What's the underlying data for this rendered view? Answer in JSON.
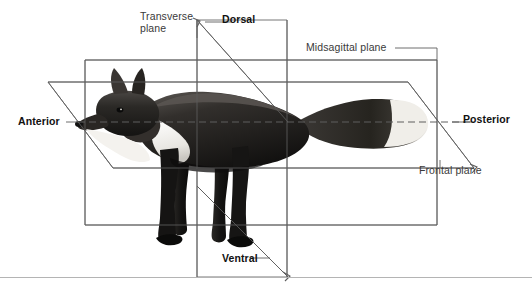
{
  "figure": {
    "background_color": "#ffffff",
    "line_color": "#555555",
    "dashed_line_color": "#666666",
    "rule_color": "#b4b4b4"
  },
  "labels": {
    "transverse_plane": "Transverse\nplane",
    "dorsal": "Dorsal",
    "midsagittal_plane": "Midsagittal plane",
    "anterior": "Anterior",
    "posterior": "Posterior",
    "frontal_plane": "Frontal plane",
    "ventral": "Ventral"
  },
  "planes": [
    {
      "name": "midsagittal-plane",
      "shape": "rectangle",
      "label": "Midsagittal plane",
      "points": "85,60 437,60 437,225 85,225"
    },
    {
      "name": "frontal-plane",
      "shape": "parallelogram",
      "label": "Frontal plane",
      "points": "48,82 408,82 474,168 113,168"
    },
    {
      "name": "transverse-plane",
      "shape": "parallelogram",
      "label": "Transverse plane",
      "points": "197,20 287,20 287,277 197,277"
    }
  ],
  "leaders": [
    {
      "name": "transverse-plane-leader",
      "from": "196,35",
      "to": "196,277"
    },
    {
      "name": "dorsal-leader",
      "from": "197,20",
      "to": "288,122"
    },
    {
      "name": "ventral-leader",
      "from": "197,186",
      "to": "288,277"
    },
    {
      "name": "anterior-axis",
      "from": "85,122",
      "to": "474,122"
    },
    {
      "name": "posterior-leader",
      "from": "437,122",
      "to": "474,122"
    }
  ],
  "axis": {
    "name": "anterior-posterior-axis",
    "dashed": true,
    "y": 122,
    "x_start": 113,
    "x_end": 437
  }
}
